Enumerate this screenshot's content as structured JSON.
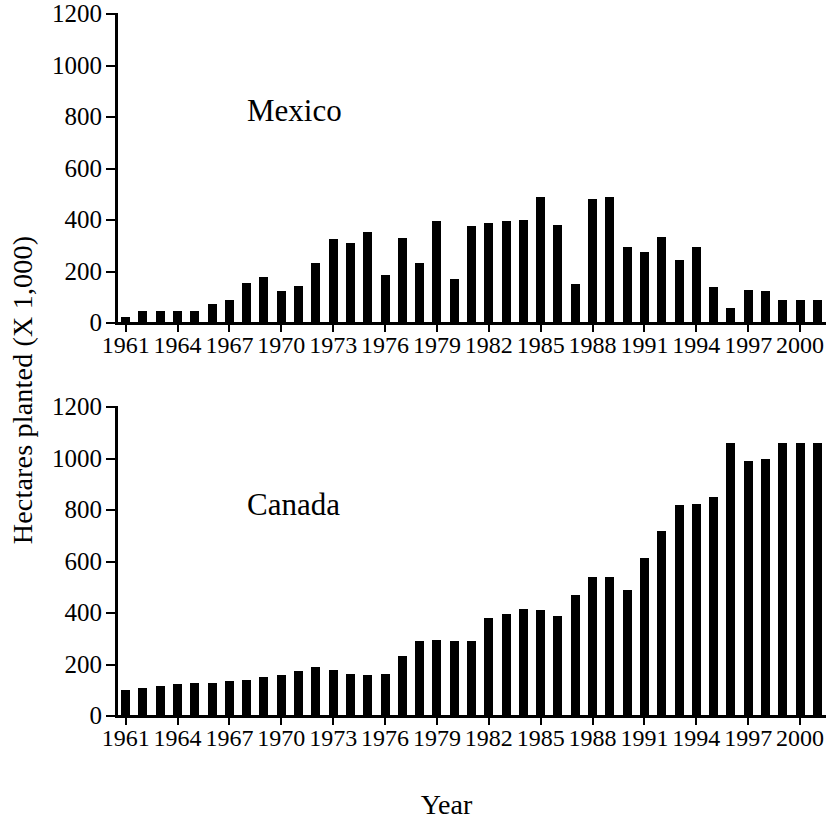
{
  "figure": {
    "x_axis_title": "Year",
    "y_axis_title": "Hectares planted (X 1,000)"
  },
  "panels": [
    {
      "id": "mexico",
      "label": "Mexico"
    },
    {
      "id": "canada",
      "label": "Canada"
    }
  ],
  "axis": {
    "y_ticks": [
      0,
      200,
      400,
      600,
      800,
      1000,
      1200
    ],
    "y_tick_labels": [
      "0",
      "200",
      "400",
      "600",
      "800",
      "1000",
      "1200"
    ],
    "x_tick_labels": [
      "1961",
      "1964",
      "1967",
      "1970",
      "1973",
      "1976",
      "1979",
      "1982",
      "1985",
      "1988",
      "1991",
      "1994",
      "1997",
      "2000"
    ],
    "x_tick_years": [
      1961,
      1964,
      1967,
      1970,
      1973,
      1976,
      1979,
      1982,
      1985,
      1988,
      1991,
      1994,
      1997,
      2000
    ]
  },
  "colors": {
    "bar": "#000000",
    "axis": "#000000",
    "background": "#ffffff"
  },
  "chart_data": [
    {
      "type": "bar",
      "title": "Mexico",
      "xlabel": "Year",
      "ylabel": "Hectares planted (X 1,000)",
      "ylim": [
        0,
        1200
      ],
      "xlim": [
        1960.5,
        2001.5
      ],
      "grid": false,
      "legend": "none",
      "categories": [
        1961,
        1962,
        1963,
        1964,
        1965,
        1966,
        1967,
        1968,
        1969,
        1970,
        1971,
        1972,
        1973,
        1974,
        1975,
        1976,
        1977,
        1978,
        1979,
        1980,
        1981,
        1982,
        1983,
        1984,
        1985,
        1986,
        1987,
        1988,
        1989,
        1990,
        1991,
        1992,
        1993,
        1994,
        1995,
        1996,
        1997,
        1998,
        1999,
        2000,
        2001
      ],
      "values": [
        25,
        45,
        45,
        45,
        47,
        75,
        90,
        155,
        180,
        125,
        145,
        235,
        325,
        310,
        355,
        185,
        330,
        235,
        395,
        170,
        375,
        390,
        395,
        400,
        490,
        380,
        150,
        480,
        490,
        295,
        275,
        335,
        245,
        295,
        140,
        60,
        130,
        125,
        90,
        90,
        90
      ]
    },
    {
      "type": "bar",
      "title": "Canada",
      "xlabel": "Year",
      "ylabel": "Hectares planted (X 1,000)",
      "ylim": [
        0,
        1200
      ],
      "xlim": [
        1960.5,
        2001.5
      ],
      "grid": false,
      "legend": "none",
      "categories": [
        1961,
        1962,
        1963,
        1964,
        1965,
        1966,
        1967,
        1968,
        1969,
        1970,
        1971,
        1972,
        1973,
        1974,
        1975,
        1976,
        1977,
        1978,
        1979,
        1980,
        1981,
        1982,
        1983,
        1984,
        1985,
        1986,
        1987,
        1988,
        1989,
        1990,
        1991,
        1992,
        1993,
        1994,
        1995,
        1996,
        1997,
        1998,
        1999,
        2000,
        2001
      ],
      "values": [
        100,
        110,
        115,
        125,
        130,
        130,
        135,
        140,
        150,
        160,
        175,
        190,
        180,
        165,
        160,
        165,
        235,
        290,
        295,
        290,
        290,
        380,
        395,
        415,
        410,
        390,
        470,
        540,
        540,
        490,
        615,
        720,
        820,
        825,
        850,
        1060,
        990,
        1000,
        1060,
        1060,
        1060
      ]
    }
  ]
}
